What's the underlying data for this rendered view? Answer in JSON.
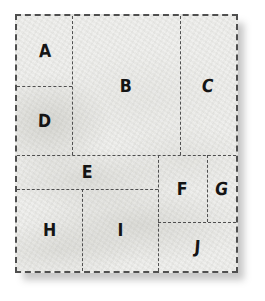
{
  "colors": {
    "background": "#ffffff",
    "paper": "#ecece9",
    "line": "#4f4f4f",
    "label": "#141414"
  },
  "diagram": {
    "type": "rectangle-partition",
    "regions": [
      {
        "id": "A",
        "label": "A"
      },
      {
        "id": "B",
        "label": "B"
      },
      {
        "id": "C",
        "label": "C"
      },
      {
        "id": "D",
        "label": "D"
      },
      {
        "id": "E",
        "label": "E"
      },
      {
        "id": "F",
        "label": "F"
      },
      {
        "id": "G",
        "label": "G"
      },
      {
        "id": "H",
        "label": "H"
      },
      {
        "id": "I",
        "label": "I"
      },
      {
        "id": "J",
        "label": "J"
      }
    ]
  }
}
